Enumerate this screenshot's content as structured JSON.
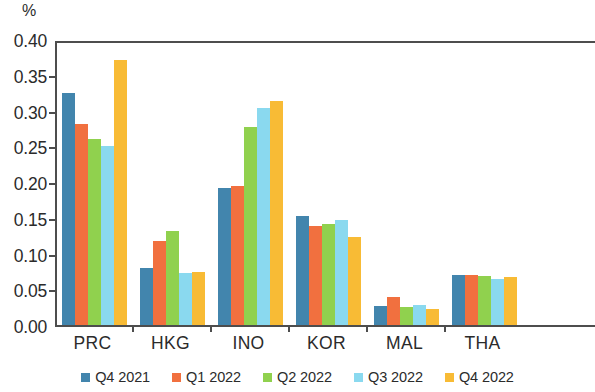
{
  "chart_data": {
    "type": "bar",
    "title": "",
    "subtitle": "",
    "xlabel": "",
    "ylabel": "%",
    "ylim": [
      0.0,
      0.4
    ],
    "y_ticks": [
      "0.00",
      "0.05",
      "0.10",
      "0.15",
      "0.20",
      "0.25",
      "0.30",
      "0.35",
      "0.40"
    ],
    "y_tick_values": [
      0.0,
      0.05,
      0.1,
      0.15,
      0.2,
      0.25,
      0.3,
      0.35,
      0.4
    ],
    "grid": false,
    "legend_position": "bottom",
    "categories": [
      "PRC",
      "HKG",
      "INO",
      "KOR",
      "MAL",
      "THA"
    ],
    "series": [
      {
        "name": "Q4 2021",
        "color": "#4285ad",
        "values": [
          0.325,
          0.08,
          0.192,
          0.152,
          0.027,
          0.07
        ]
      },
      {
        "name": "Q1 2022",
        "color": "#f1703f",
        "values": [
          0.281,
          0.117,
          0.195,
          0.138,
          0.039,
          0.07
        ]
      },
      {
        "name": "Q2 2022",
        "color": "#90d14e",
        "values": [
          0.26,
          0.131,
          0.277,
          0.141,
          0.025,
          0.068
        ]
      },
      {
        "name": "Q3 2022",
        "color": "#8ad9ef",
        "values": [
          0.25,
          0.073,
          0.303,
          0.147,
          0.028,
          0.065
        ]
      },
      {
        "name": "Q4 2022",
        "color": "#f8bb35",
        "values": [
          0.371,
          0.074,
          0.313,
          0.123,
          0.022,
          0.067
        ]
      }
    ]
  },
  "axis": {
    "unit_label": "%"
  },
  "colors": {
    "axis_line": "#4d4d4d",
    "text": "#2b2b2b",
    "background": "#ffffff"
  }
}
